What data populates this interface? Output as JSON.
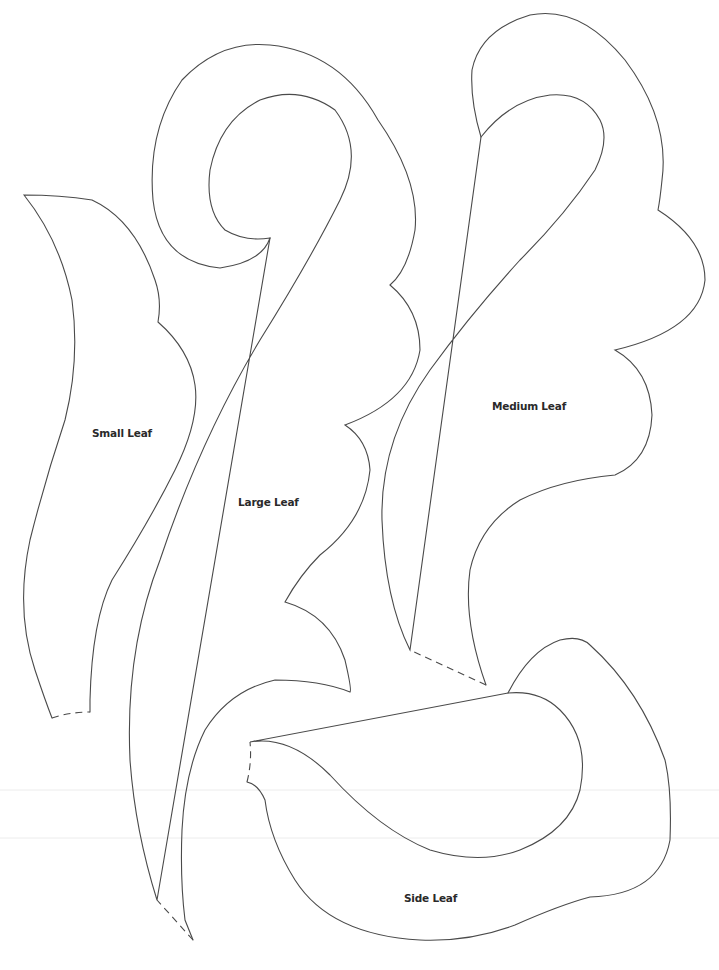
{
  "page": {
    "background": "#ffffff",
    "line_color": "#4a4a4a"
  },
  "shapes": [
    {
      "id": "small-leaf",
      "label": "Small Leaf",
      "label_x": 92,
      "label_y": 427
    },
    {
      "id": "large-leaf",
      "label": "Large Leaf",
      "label_x": 238,
      "label_y": 496
    },
    {
      "id": "medium-leaf",
      "label": "Medium Leaf",
      "label_x": 492,
      "label_y": 400
    },
    {
      "id": "side-leaf",
      "label": "Side Leaf",
      "label_x": 404,
      "label_y": 892
    }
  ]
}
